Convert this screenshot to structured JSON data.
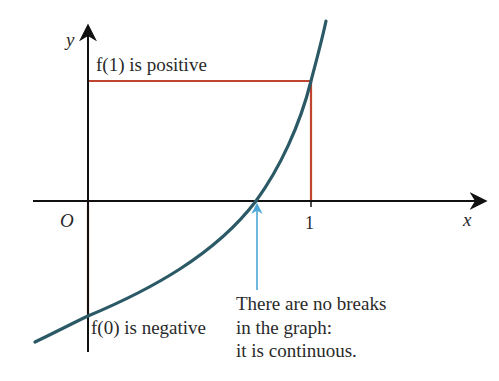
{
  "diagram": {
    "axes": {
      "x_label": "x",
      "y_label": "y",
      "origin_label": "O",
      "x_tick_label": "1"
    },
    "annotations": {
      "f1_label": "f(1) is positive",
      "f0_label": "f(0) is negative",
      "note_line1": "There are no breaks",
      "note_line2": "in the graph:",
      "note_line3": "it is continuous."
    },
    "colors": {
      "axis": "#111111",
      "curve": "#2b5a66",
      "guide": "#c0452e",
      "pointer": "#4aa6d6",
      "text": "#2a2a2a"
    }
  }
}
